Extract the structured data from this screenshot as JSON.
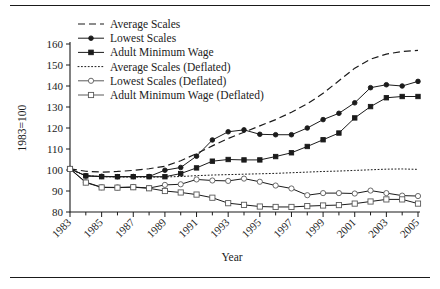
{
  "figure": {
    "ylabel": "1983=100",
    "xlabel": "Year",
    "rules": {
      "top": "top-rule",
      "bottom": "bottom-rule"
    }
  },
  "chart_data": {
    "type": "line",
    "title": "",
    "xlabel": "Year",
    "ylabel": "1983=100",
    "ylim": [
      80,
      160
    ],
    "xlim": [
      1983,
      2005
    ],
    "yticks": [
      80,
      90,
      100,
      110,
      120,
      130,
      140,
      150,
      160
    ],
    "xticks": [
      1983,
      1985,
      1987,
      1989,
      1991,
      1993,
      1995,
      1997,
      1999,
      2001,
      2003,
      2005
    ],
    "xtick_labels": [
      "1983",
      "1985",
      "1987",
      "1989",
      "1991",
      "1993",
      "1995",
      "1997",
      "1999",
      "2001",
      "2003",
      "2005"
    ],
    "ytick_labels": [
      "80",
      "90",
      "100",
      "110",
      "120",
      "130",
      "140",
      "150",
      "160"
    ],
    "minor_xticks_every": 1,
    "grid": false,
    "legend_position": "upper-left",
    "x": [
      1983,
      1984,
      1985,
      1986,
      1987,
      1988,
      1989,
      1990,
      1991,
      1992,
      1993,
      1994,
      1995,
      1996,
      1997,
      1998,
      1999,
      2000,
      2001,
      2002,
      2003,
      2004,
      2005
    ],
    "series": [
      {
        "name": "Average Scales",
        "style": "dashed",
        "marker": "none",
        "marker_fill": "none",
        "color": "#1b1b1b",
        "values": [
          100.6,
          99.4,
          99.0,
          99.3,
          99.8,
          100.6,
          101.8,
          104.4,
          107.8,
          111.5,
          115.0,
          118.0,
          121.0,
          124.0,
          127.5,
          131.5,
          136.5,
          142.5,
          148.5,
          152.8,
          155.2,
          156.4,
          157.0
        ]
      },
      {
        "name": "Lowest Scales",
        "style": "solid",
        "marker": "circle",
        "marker_fill": "filled",
        "color": "#1b1b1b",
        "values": [
          100.7,
          97.2,
          97.0,
          96.8,
          96.9,
          96.9,
          99.9,
          101.2,
          106.6,
          114.3,
          118.2,
          119.1,
          117.0,
          116.8,
          116.8,
          120.0,
          124.0,
          127.0,
          132.0,
          139.2,
          140.6,
          140.0,
          142.2
        ]
      },
      {
        "name": "Adult Minimum Wage",
        "style": "solid",
        "marker": "square",
        "marker_fill": "filled",
        "color": "#1b1b1b",
        "values": [
          100.5,
          97.2,
          96.8,
          96.8,
          96.8,
          96.8,
          96.8,
          98.3,
          101.0,
          104.2,
          105.0,
          104.8,
          104.8,
          106.4,
          108.2,
          111.2,
          114.4,
          117.6,
          124.8,
          130.2,
          134.4,
          135.0,
          135.0
        ]
      },
      {
        "name": "Average Scales (Deflated)",
        "style": "dotted",
        "marker": "none",
        "marker_fill": "none",
        "color": "#1b1b1b",
        "values": [
          100.3,
          97.3,
          96.8,
          96.7,
          96.6,
          96.6,
          96.7,
          96.9,
          97.3,
          97.6,
          97.8,
          98.0,
          98.2,
          98.4,
          98.7,
          99.0,
          99.3,
          99.5,
          99.8,
          100.1,
          100.4,
          100.5,
          100.3
        ]
      },
      {
        "name": "Lowest Scales (Deflated)",
        "style": "solid",
        "marker": "circle",
        "marker_fill": "open",
        "color": "#5a5a5a",
        "values": [
          100.6,
          94.2,
          91.8,
          91.7,
          91.9,
          91.4,
          92.9,
          93.2,
          95.5,
          95.0,
          94.8,
          95.9,
          94.4,
          92.6,
          91.2,
          88.0,
          89.0,
          89.0,
          88.8,
          90.2,
          89.0,
          87.8,
          87.6
        ]
      },
      {
        "name": "Adult Minimum Wage (Deflated)",
        "style": "solid",
        "marker": "square",
        "marker_fill": "open",
        "color": "#5a5a5a",
        "values": [
          100.5,
          94.0,
          91.7,
          91.6,
          91.8,
          91.3,
          90.0,
          89.3,
          88.3,
          86.8,
          84.2,
          83.4,
          82.6,
          82.4,
          82.4,
          82.8,
          83.1,
          83.3,
          84.0,
          85.0,
          86.0,
          86.0,
          84.0
        ]
      }
    ]
  },
  "legend": {
    "items": [
      {
        "label": "Average Scales",
        "style": "dashed",
        "marker": "none"
      },
      {
        "label": "Lowest Scales",
        "style": "solid",
        "marker": "circle-filled"
      },
      {
        "label": "Adult Minimum Wage",
        "style": "solid",
        "marker": "square-filled"
      },
      {
        "label": "Average Scales (Deflated)",
        "style": "dotted",
        "marker": "none"
      },
      {
        "label": "Lowest Scales (Deflated)",
        "style": "solid",
        "marker": "circle-open"
      },
      {
        "label": "Adult Minimum Wage (Deflated)",
        "style": "solid",
        "marker": "square-open"
      }
    ]
  }
}
